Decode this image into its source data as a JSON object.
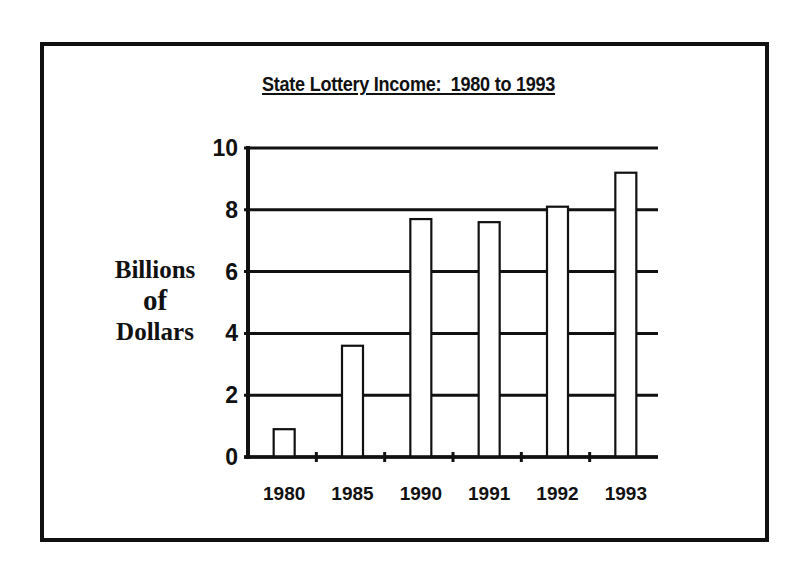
{
  "chart_data": {
    "type": "bar",
    "title": "State Lottery Income:  1980 to 1993",
    "xlabel": "",
    "ylabel": "Billions of Dollars",
    "ylabel_lines": [
      "Billions",
      "of",
      "Dollars"
    ],
    "categories": [
      "1980",
      "1985",
      "1990",
      "1991",
      "1992",
      "1993"
    ],
    "values": [
      0.9,
      3.6,
      7.7,
      7.6,
      8.1,
      9.2
    ],
    "ylim": [
      0,
      10
    ],
    "yticks": [
      "0",
      "2",
      "4",
      "6",
      "8",
      "10"
    ],
    "grid": true,
    "legend": null,
    "colors": {
      "bar_fill": "#ffffff",
      "bar_stroke": "#111111",
      "grid": "#111111"
    }
  }
}
